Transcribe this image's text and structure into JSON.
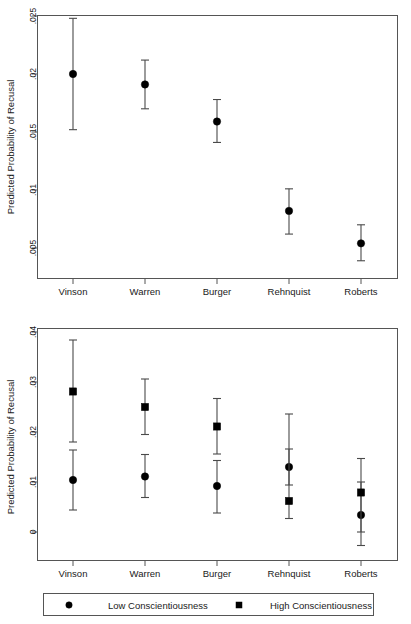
{
  "chart_data": [
    {
      "type": "scatter",
      "panel": "top",
      "title": "",
      "xlabel": "",
      "ylabel": "Predicted Probability of Recusal",
      "categories": [
        "Vinson",
        "Warren",
        "Burger",
        "Rehnquist",
        "Roberts"
      ],
      "yticks": [
        0.005,
        0.01,
        0.015,
        0.02,
        0.025
      ],
      "ytick_labels": [
        ".005",
        ".01",
        ".015",
        ".02",
        ".025"
      ],
      "ylim": [
        0.0035,
        0.0265
      ],
      "grid": false,
      "legend": "none",
      "series": [
        {
          "name": "Predicted Probability of Recusal",
          "marker": "circle",
          "values": [
            0.02,
            0.0191,
            0.0159,
            0.0082,
            0.0054
          ],
          "ci_low": [
            0.0152,
            0.017,
            0.0141,
            0.0062,
            0.0039
          ],
          "ci_high": [
            0.0248,
            0.0212,
            0.0178,
            0.0101,
            0.007
          ]
        }
      ]
    },
    {
      "type": "scatter",
      "panel": "bottom",
      "title": "",
      "xlabel": "",
      "ylabel": "Predicted Probability of Recusal",
      "categories": [
        "Vinson",
        "Warren",
        "Burger",
        "Rehnquist",
        "Roberts"
      ],
      "yticks": [
        0,
        0.01,
        0.02,
        0.03,
        0.04
      ],
      "ytick_labels": [
        "0",
        ".01",
        ".02",
        ".03",
        ".04"
      ],
      "ylim": [
        -0.005,
        0.0425
      ],
      "grid": false,
      "legend": "below",
      "series": [
        {
          "name": "Low Conscientiousness",
          "marker": "circle",
          "values": [
            0.0104,
            0.0111,
            0.0092,
            0.013,
            0.0034
          ],
          "ci_low": [
            0.0044,
            0.0069,
            0.0038,
            0.0094,
            -0.0027
          ],
          "ci_high": [
            0.0164,
            0.0155,
            0.0143,
            0.0166,
            0.01
          ]
        },
        {
          "name": "High Conscientiousness",
          "marker": "square",
          "values": [
            0.0281,
            0.025,
            0.0211,
            0.0062,
            0.0079
          ],
          "ci_low": [
            0.018,
            0.0195,
            0.0156,
            0.0027,
            0.0
          ],
          "ci_high": [
            0.0384,
            0.0306,
            0.0267,
            0.0236,
            0.0147
          ]
        }
      ]
    }
  ],
  "top_panel": {
    "y_axis_title": "Predicted Probability of Recusal",
    "y_tick_labels": [
      ".025",
      ".02",
      ".015",
      ".01",
      ".005"
    ],
    "x_tick_labels": [
      "Vinson",
      "Warren",
      "Burger",
      "Rehnquist",
      "Roberts"
    ]
  },
  "bottom_panel": {
    "y_axis_title": "Predicted Probability of Recusal",
    "y_tick_labels": [
      ".04",
      ".03",
      ".02",
      ".01",
      "0"
    ],
    "x_tick_labels": [
      "Vinson",
      "Warren",
      "Burger",
      "Rehnquist",
      "Roberts"
    ]
  },
  "legend": {
    "entries": [
      {
        "label": "Low Conscientiousness",
        "marker": "circle"
      },
      {
        "label": "High Conscientiousness",
        "marker": "square"
      }
    ]
  },
  "colors": {
    "marker": "#000000",
    "whisker": "#4a4a4a",
    "frame": "#555555",
    "text": "#1a1a1a",
    "background": "#ffffff"
  }
}
